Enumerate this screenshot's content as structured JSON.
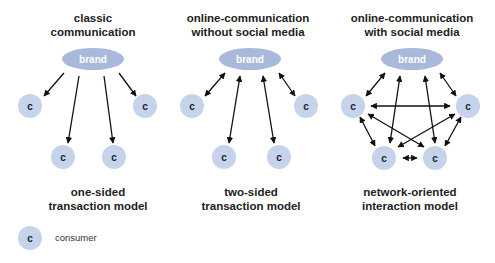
{
  "colors": {
    "node_fill": "#c5d4ea",
    "brand_fill": "#a8b9dc",
    "brand_text": "#ffffff",
    "node_text": "#1a1a2e",
    "arrow": "#111111",
    "text": "#222222"
  },
  "diagrams": [
    {
      "title_line1": "classic",
      "title_line2": "communication",
      "brand_label": "brand",
      "consumer_label": "c",
      "caption_line1": "one-sided",
      "caption_line2": "transaction model",
      "arrow_type": "brand-to-consumer"
    },
    {
      "title_line1": "online-communication",
      "title_line2": "without social media",
      "brand_label": "brand",
      "consumer_label": "c",
      "caption_line1": "two-sided",
      "caption_line2": "transaction model",
      "arrow_type": "bidirectional brand-consumer"
    },
    {
      "title_line1": "online-communication",
      "title_line2": "with social media",
      "brand_label": "brand",
      "consumer_label": "c",
      "caption_line1": "network-oriented",
      "caption_line2": "interaction model",
      "arrow_type": "bidirectional all-to-all"
    }
  ],
  "legend": {
    "symbol_label": "c",
    "description": "consumer"
  }
}
